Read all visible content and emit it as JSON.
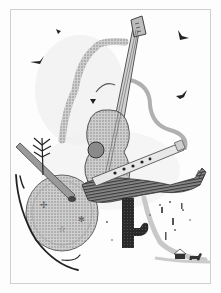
{
  "artwork": {
    "subject": "musical instruments illustration",
    "elements": [
      "guitar",
      "electric-guitar",
      "flute",
      "drum",
      "cactus",
      "birds",
      "tree-sprig",
      "hut",
      "dog"
    ],
    "colors": {
      "paper": "#fdfdfd",
      "frame": "#cfcfcf",
      "ink_dark": "#1e1e1e",
      "ink_mid": "#6a6a6a",
      "ink_light": "#a9a9a9",
      "wash": "#d9d9d9"
    }
  }
}
